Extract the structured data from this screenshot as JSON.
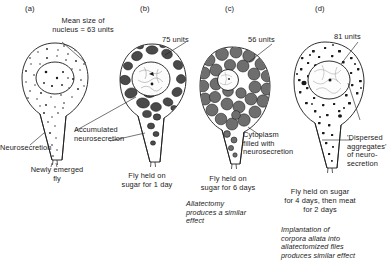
{
  "figure": {
    "type": "scientific-diagram",
    "panels": [
      {
        "id": "a",
        "letter": "(a)",
        "callouts": [
          {
            "name": "nucleus-size",
            "text": "Mean size of\nnucleus = 63 units",
            "value": 63,
            "unit": "units"
          },
          {
            "name": "neurosecretion",
            "text": "Neurosecretion"
          }
        ],
        "caption": "Newly emerged\nfly",
        "note": "",
        "cell_style": "fine-stipple"
      },
      {
        "id": "b",
        "letter": "(b)",
        "callouts": [
          {
            "name": "nucleus-size",
            "text": "75 units",
            "value": 75,
            "unit": "units"
          },
          {
            "name": "accumulated-neurosecretion",
            "text": "Accumulated\nneurosecretion"
          }
        ],
        "caption": "Fly held on\nsugar for 1 day",
        "note": "",
        "cell_style": "dark-blobs"
      },
      {
        "id": "c",
        "letter": "(c)",
        "callouts": [
          {
            "name": "nucleus-size",
            "text": "56 units",
            "value": 56,
            "unit": "units"
          },
          {
            "name": "cytoplasm-filled",
            "text": "Cytoplasm\nfilled with\nneurosecretion"
          }
        ],
        "caption": "Fly held on\nsugar for 6 days",
        "note": "Allatectomy\nproduces a similar\neffect",
        "cell_style": "packed-granules"
      },
      {
        "id": "d",
        "letter": "(d)",
        "callouts": [
          {
            "name": "nucleus-size",
            "text": "81 units",
            "value": 81,
            "unit": "units"
          },
          {
            "name": "dispersed-aggregates",
            "text": "'Dispersed\naggregates'\nof neuro-\nsecretion"
          }
        ],
        "caption": "Fly held on sugar\nfor 4 days, then meat\nfor 2 days",
        "note": "Implantation of\ncorpora allata into\nallatectomized flies\nproduces similar effect",
        "cell_style": "coarse-stipple"
      }
    ],
    "colors": {
      "ink": "#1a1a1a",
      "granule_dark": "#4a4a4a",
      "granule_mid": "#6e6e6e",
      "nucleus_light": "#fbfbfb",
      "background": "#ffffff"
    }
  }
}
